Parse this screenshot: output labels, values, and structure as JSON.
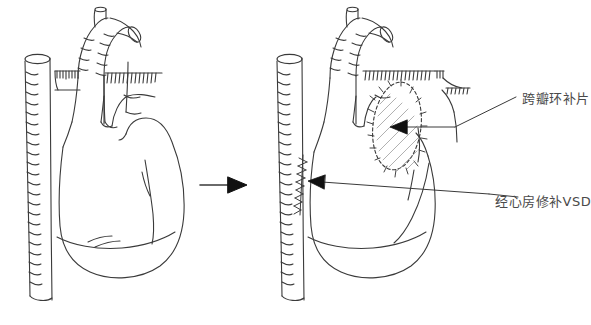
{
  "diagram": {
    "type": "medical-line-art",
    "background_color": "#ffffff",
    "stroke_color": "#3a3a3a",
    "label_color": "#4a4a4a",
    "panels": [
      {
        "id": "pre-operative",
        "name": "left-heart-preoperative",
        "position": "left",
        "description": "Heart before repair"
      },
      {
        "id": "post-operative",
        "name": "right-heart-postoperative",
        "position": "right",
        "description": "Heart after repair with patch and suture line"
      }
    ],
    "transition_arrow": {
      "name": "transition-arrow",
      "direction": "right"
    },
    "annotations": [
      {
        "id": "patch",
        "text": "跨瓣环补片",
        "target": "transannular-patch",
        "leader": "diagonal"
      },
      {
        "id": "vsd",
        "text": "经心房修补VSD",
        "target": "atrial-suture-line",
        "leader": "horizontal"
      }
    ]
  },
  "labels": {
    "transannular_patch": "跨瓣环补片",
    "transatrial_vsd_repair": "经心房修补VSD"
  }
}
